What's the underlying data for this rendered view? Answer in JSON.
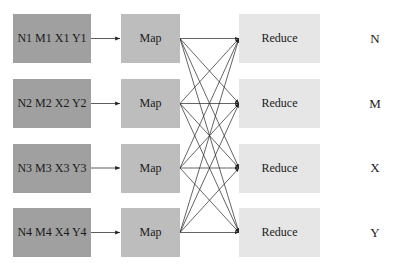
{
  "diagram": {
    "type": "mapreduce-flow",
    "inputs": [
      {
        "label": "N1 M1 X1 Y1"
      },
      {
        "label": "N2 M2 X2 Y2"
      },
      {
        "label": "N3 M3 X3 Y3"
      },
      {
        "label": "N4 M4 X4 Y4"
      }
    ],
    "maps": [
      {
        "label": "Map"
      },
      {
        "label": "Map"
      },
      {
        "label": "Map"
      },
      {
        "label": "Map"
      }
    ],
    "reduces": [
      {
        "label": "Reduce"
      },
      {
        "label": "Reduce"
      },
      {
        "label": "Reduce"
      },
      {
        "label": "Reduce"
      }
    ],
    "keys": [
      {
        "label": "N"
      },
      {
        "label": "M"
      },
      {
        "label": "X"
      },
      {
        "label": "Y"
      }
    ],
    "edges": {
      "input_to_map": "one-to-one",
      "map_to_reduce": "all-to-all"
    },
    "colors": {
      "input_fill": "#a0a0a0",
      "map_fill": "#bdbdbd",
      "reduce_fill": "#e6e6e6",
      "line": "#222222"
    }
  }
}
